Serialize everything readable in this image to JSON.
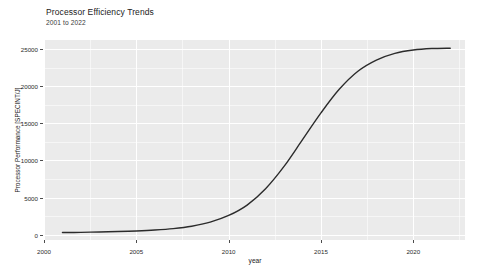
{
  "chart_data": {
    "type": "line",
    "title": "Processor Efficiency Trends",
    "subtitle": "2001 to 2022",
    "xlabel": "year",
    "ylabel": "Processor Performance [SPECINT/J]",
    "xlim": [
      2000.0,
      2022.8
    ],
    "ylim": [
      -700,
      26200
    ],
    "grid": true,
    "legend": "none",
    "line_color": "#2b2b2b",
    "panel_color": "#ebebeb",
    "gridline_color": "#ffffff",
    "x_ticks": [
      2000,
      2005,
      2010,
      2015,
      2020
    ],
    "y_ticks": [
      0,
      5000,
      10000,
      15000,
      20000,
      25000
    ],
    "x_tick_labels": [
      "2000",
      "2005",
      "2010",
      "2015",
      "2020"
    ],
    "y_tick_labels": [
      "0",
      "5000",
      "10000",
      "15000",
      "20000",
      "25000"
    ],
    "x_minor_ticks": [
      2002.5,
      2007.5,
      2012.5,
      2017.5,
      2022.5
    ],
    "y_minor_ticks": [
      2500,
      7500,
      12500,
      17500,
      22500
    ],
    "series": [
      {
        "name": "Processor Performance [SPECINT/J]",
        "x": [
          2001,
          2002,
          2003,
          2004,
          2005,
          2006,
          2007,
          2008,
          2009,
          2010,
          2011,
          2012,
          2013,
          2014,
          2015,
          2016,
          2017,
          2018,
          2019,
          2020,
          2021,
          2022
        ],
        "values": [
          300,
          330,
          380,
          440,
          520,
          640,
          830,
          1150,
          1700,
          2600,
          4000,
          6200,
          9200,
          12800,
          16400,
          19600,
          22000,
          23500,
          24400,
          24850,
          25050,
          25100
        ]
      }
    ]
  }
}
